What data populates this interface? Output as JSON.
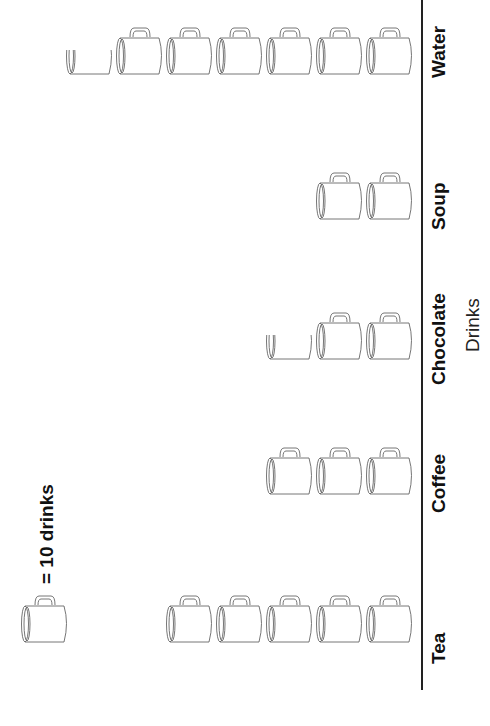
{
  "legend": {
    "text": "= 10 drinks",
    "unit_value": 10,
    "icon": "mug-icon"
  },
  "axis": {
    "title": "Drinks"
  },
  "chart_data": {
    "type": "bar",
    "subtype": "pictograph",
    "orientation": "rotated 90deg (categories along right edge)",
    "title": "",
    "xlabel": "Drinks",
    "ylabel": "",
    "unit": "1 mug = 10 drinks",
    "categories": [
      "Tea",
      "Coffee",
      "Chocolate",
      "Soup",
      "Water"
    ],
    "values": [
      50,
      30,
      25,
      20,
      65
    ],
    "icons": [
      5,
      3,
      2.5,
      2,
      6.5
    ],
    "grid": false,
    "legend_position": "left"
  },
  "rows": [
    {
      "label": "Tea",
      "full": 5,
      "partial": 0
    },
    {
      "label": "Coffee",
      "full": 3,
      "partial": 0
    },
    {
      "label": "Chocolate",
      "full": 2,
      "partial": 0.5
    },
    {
      "label": "Soup",
      "full": 2,
      "partial": 0
    },
    {
      "label": "Water",
      "full": 6,
      "partial": 0.5
    }
  ]
}
